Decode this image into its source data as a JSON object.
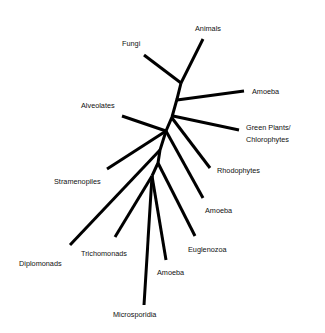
{
  "diagram": {
    "type": "unrooted phylogenetic tree",
    "taxa": [
      {
        "id": "animals",
        "label": "Animals"
      },
      {
        "id": "fungi",
        "label": "Fungi"
      },
      {
        "id": "amoeba-1",
        "label": "Amoeba"
      },
      {
        "id": "alveolates",
        "label": "Alveolates"
      },
      {
        "id": "green-plants",
        "label_line1": "Green Plants/",
        "label_line2": "Chlorophytes"
      },
      {
        "id": "rhodophytes",
        "label": "Rhodophytes"
      },
      {
        "id": "stramenopiles",
        "label": "Stramenopiles"
      },
      {
        "id": "amoeba-2",
        "label": "Amoeba"
      },
      {
        "id": "euglenozoa",
        "label": "Euglenozoa"
      },
      {
        "id": "diplomonads",
        "label": "Diplomonads"
      },
      {
        "id": "trichomonads",
        "label": "Trichomonads"
      },
      {
        "id": "amoeba-3",
        "label": "Amoeba"
      },
      {
        "id": "microsporidia",
        "label": "Microsporidia"
      }
    ],
    "line_color": "#000000",
    "background": "#ffffff"
  }
}
